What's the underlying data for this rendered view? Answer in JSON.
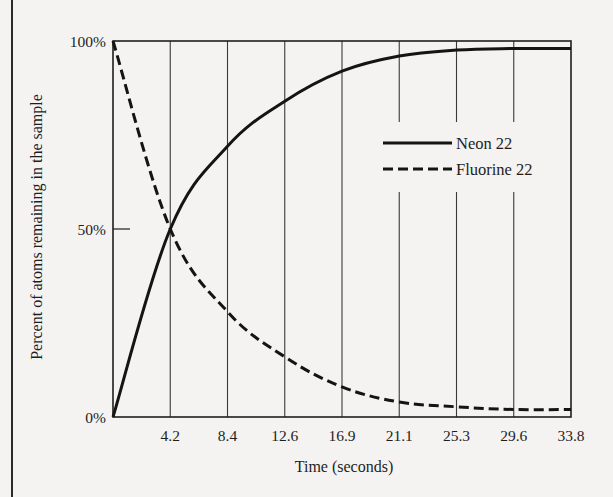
{
  "chart_data": {
    "type": "line",
    "title": "",
    "xlabel": "Time (seconds)",
    "ylabel": "Percent of atoms remaining in the sample",
    "x": [
      0,
      4.2,
      8.4,
      12.6,
      16.9,
      21.1,
      25.3,
      29.6,
      33.8
    ],
    "x_tick_labels": [
      "4.2",
      "8.4",
      "12.6",
      "16.9",
      "21.1",
      "25.3",
      "29.6",
      "33.8"
    ],
    "y_tick_labels": [
      "0%",
      "50%",
      "100%"
    ],
    "y_ticks": [
      0,
      50,
      100
    ],
    "xlim": [
      0,
      33.8
    ],
    "ylim": [
      0,
      100
    ],
    "grid": "vertical lines at each x tick",
    "legend_position": "upper right, inside plot",
    "series": [
      {
        "name": "Neon 22",
        "style": "solid",
        "values": [
          0,
          50,
          72,
          84,
          92,
          96,
          97.6,
          98,
          98
        ]
      },
      {
        "name": "Fluorine 22",
        "style": "dashed",
        "values": [
          100,
          50,
          28,
          16,
          8,
          4,
          2.7,
          2,
          2
        ]
      }
    ]
  },
  "legend": {
    "items": [
      {
        "label": "Neon 22",
        "style": "solid"
      },
      {
        "label": "Fluorine 22",
        "style": "dashed"
      }
    ]
  },
  "colors": {
    "background": "#f4f3f1",
    "ink": "#1e1e1e",
    "grid": "#3a3a3a"
  }
}
